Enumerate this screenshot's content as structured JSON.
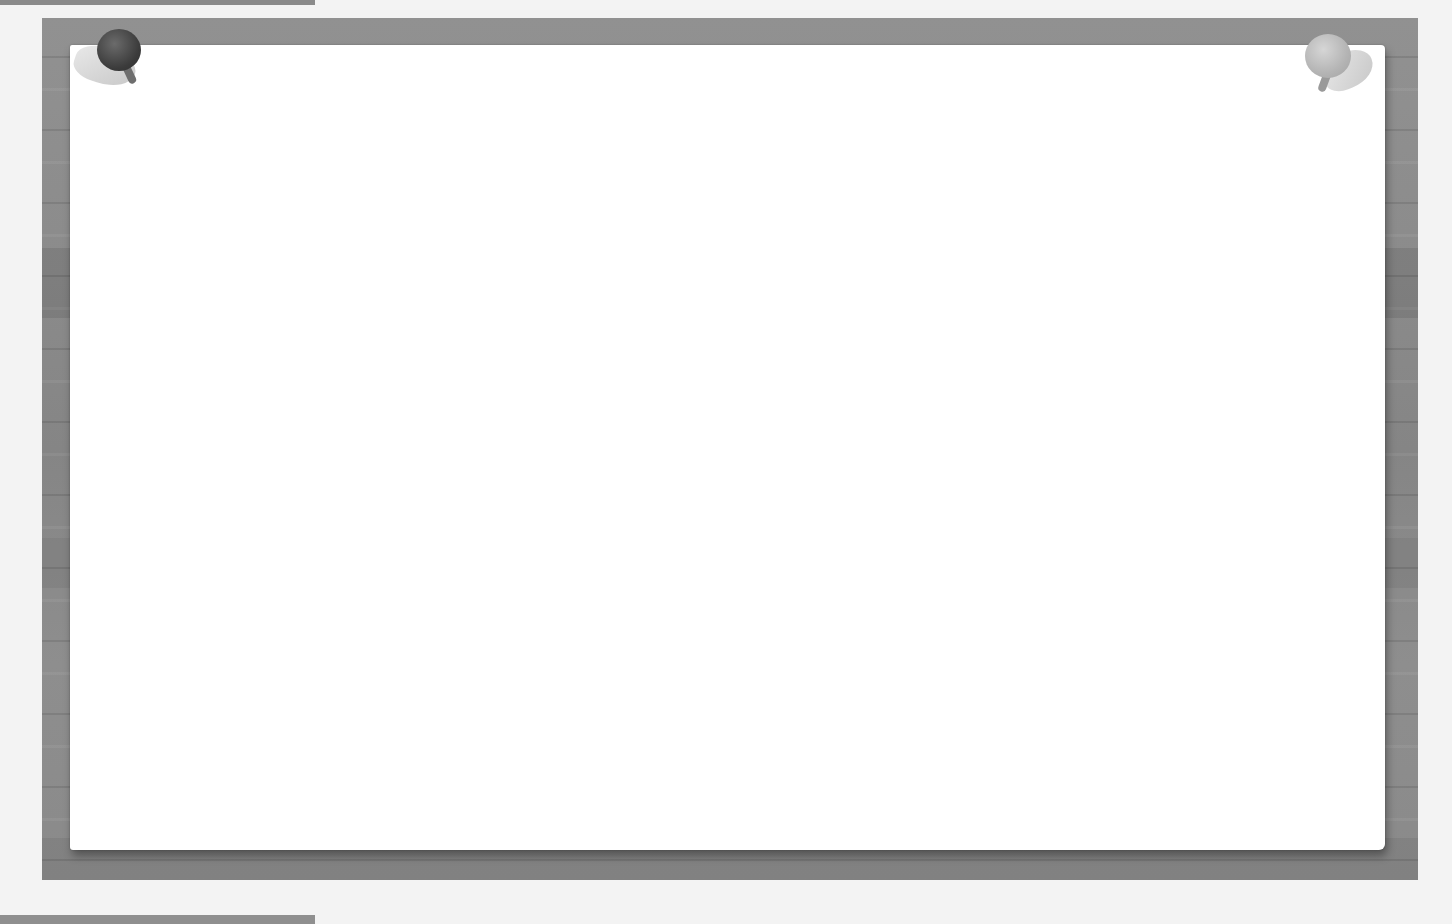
{
  "scene": {
    "description": "Blank pinned paper on a wooden bulletin board",
    "colors": {
      "page_background": "#f3f3f3",
      "board": "#8d8d8d",
      "paper": "#ffffff",
      "pin_left": "#3b3b3b",
      "pin_right": "#b4b4b4"
    },
    "pins": [
      {
        "position": "top-left",
        "icon": "push-pin-icon"
      },
      {
        "position": "top-right",
        "icon": "push-pin-icon"
      }
    ],
    "paper_text": ""
  }
}
